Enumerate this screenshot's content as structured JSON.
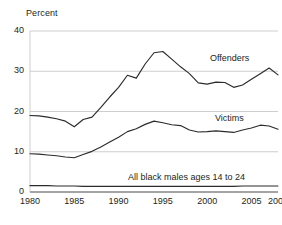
{
  "chart_data": {
    "type": "line",
    "title": "",
    "ylabel": "Percent",
    "xlabel": "",
    "ylim": [
      0,
      40
    ],
    "xlim": [
      1980,
      2008
    ],
    "yticks": [
      0,
      10,
      20,
      30,
      40
    ],
    "ytick_labels": [
      "0",
      "10",
      "20",
      "30",
      "40"
    ],
    "xticks": [
      1980,
      1985,
      1990,
      1995,
      2000,
      2005,
      2008
    ],
    "xtick_labels": [
      "1980",
      "1985",
      "1990",
      "1995",
      "2000",
      "2005",
      "2008"
    ],
    "grid": "horizontal",
    "legend_position": "inline-right",
    "x": [
      1980,
      1981,
      1982,
      1983,
      1984,
      1985,
      1986,
      1987,
      1988,
      1989,
      1990,
      1991,
      1992,
      1993,
      1994,
      1995,
      1996,
      1997,
      1998,
      1999,
      2000,
      2001,
      2002,
      2003,
      2004,
      2005,
      2006,
      2007,
      2008
    ],
    "series": [
      {
        "name": "Offenders",
        "values": [
          19.0,
          18.9,
          18.6,
          18.2,
          17.6,
          16.2,
          18.0,
          18.6,
          21.0,
          23.6,
          26.0,
          29.0,
          28.3,
          31.8,
          34.6,
          34.9,
          33.0,
          31.1,
          29.4,
          27.1,
          26.8,
          27.3,
          27.2,
          26.0,
          26.6,
          28.0,
          29.4,
          30.8,
          29.1
        ]
      },
      {
        "name": "Victims",
        "values": [
          9.5,
          9.4,
          9.2,
          9.0,
          8.7,
          8.5,
          9.3,
          10.1,
          11.2,
          12.4,
          13.6,
          15.0,
          15.7,
          16.8,
          17.6,
          17.2,
          16.7,
          16.5,
          15.4,
          14.9,
          15.0,
          15.2,
          15.0,
          14.8,
          15.4,
          15.9,
          16.6,
          16.4,
          15.6
        ]
      },
      {
        "name": "All black males ages 14 to 24",
        "values": [
          1.6,
          1.6,
          1.6,
          1.5,
          1.5,
          1.5,
          1.4,
          1.4,
          1.4,
          1.4,
          1.4,
          1.4,
          1.4,
          1.4,
          1.4,
          1.4,
          1.4,
          1.4,
          1.4,
          1.4,
          1.4,
          1.4,
          1.4,
          1.4,
          1.5,
          1.5,
          1.5,
          1.5,
          1.5
        ]
      }
    ],
    "series_colors": [
      "#2b2b2b",
      "#2b2b2b",
      "#2b2b2b"
    ],
    "grid_color": "#b9b9b9",
    "axis_color": "#4a4a4a"
  }
}
